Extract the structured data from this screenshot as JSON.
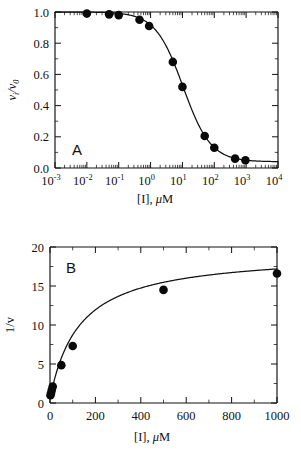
{
  "figure": {
    "background": "#ffffff",
    "ink_color": "#111111",
    "marker_color": "#0a0a0a"
  },
  "panels": [
    {
      "letter": "A",
      "xlabel_main": "[I], ",
      "xlabel_italic": "μ",
      "xlabel_tail": "M",
      "ylabel_main": "v",
      "ylabel_sub1": "i",
      "ylabel_slash": "/v",
      "ylabel_sub2": "0",
      "xticks": [
        "-3",
        "-2",
        "-1",
        "0",
        "1",
        "2",
        "3",
        "4"
      ],
      "xtick_base": "10",
      "yticks": [
        "1.0",
        "0.8",
        "0.6",
        "0.4",
        "0.2",
        "0.0"
      ]
    },
    {
      "letter": "B",
      "xlabel_main": "[I], ",
      "xlabel_italic": "μ",
      "xlabel_tail": "M",
      "ylabel": "1/v",
      "xticks": [
        "0",
        "200",
        "400",
        "600",
        "800",
        "1000"
      ],
      "yticks": [
        "0",
        "5",
        "10",
        "15",
        "20"
      ]
    }
  ],
  "chart_data": [
    {
      "type": "scatter",
      "id": "panel-a",
      "title": "A",
      "xlabel": "[I], μM",
      "ylabel": "v_i/v_0",
      "xscale": "log",
      "xlim": [
        0.001,
        10000
      ],
      "ylim": [
        0.0,
        1.0
      ],
      "grid": false,
      "legend": "none",
      "x": [
        0.01,
        0.05,
        0.1,
        0.45,
        0.9,
        5,
        10,
        50,
        100,
        450,
        950
      ],
      "y": [
        0.99,
        0.985,
        0.98,
        0.95,
        0.91,
        0.68,
        0.52,
        0.205,
        0.13,
        0.06,
        0.05
      ],
      "fit_curve": {
        "model": "sigmoid_ic50",
        "top": 1.0,
        "bottom": 0.04,
        "ic50": 10.5,
        "hill": 1.0
      }
    },
    {
      "type": "scatter",
      "id": "panel-b",
      "title": "B",
      "xlabel": "[I], μM",
      "ylabel": "1/v",
      "xscale": "linear",
      "xlim": [
        0,
        1000
      ],
      "ylim": [
        0,
        20
      ],
      "grid": false,
      "legend": "none",
      "x": [
        2,
        5,
        8,
        12,
        50,
        100,
        500,
        1000
      ],
      "y": [
        1.0,
        1.3,
        1.7,
        2.1,
        4.85,
        7.3,
        14.5,
        16.6
      ],
      "fit_curve": {
        "model": "hyperbolic",
        "vmax": 18.8,
        "km": 130,
        "offset": 0.55
      }
    }
  ]
}
